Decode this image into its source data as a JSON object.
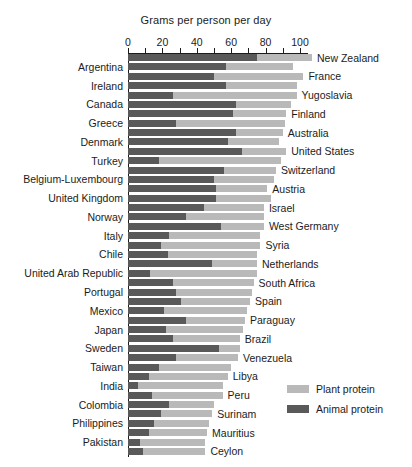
{
  "chart_data": {
    "type": "bar",
    "orientation": "horizontal",
    "stacked": true,
    "title": "Grams per person per day",
    "xlabel": "Grams per person per day",
    "ylabel": "",
    "xlim": [
      0,
      105
    ],
    "xticks": [
      0,
      10,
      20,
      30,
      40,
      50,
      60,
      70,
      80,
      90,
      100
    ],
    "xtick_labels": [
      "0",
      "",
      "20",
      "",
      "40",
      "",
      "60",
      "",
      "80",
      "",
      "100"
    ],
    "grid": false,
    "legend_position": "lower-right",
    "colors": {
      "plant_protein": "#b9b9b9",
      "animal_protein": "#595959",
      "axis": "#1b1b1b",
      "background": "#ffffff"
    },
    "series": [
      {
        "name": "Animal protein",
        "color": "#595959"
      },
      {
        "name": "Plant protein",
        "color": "#b9b9b9"
      }
    ],
    "label_side_note": "Labels alternate: odd-index rows labelled on the right, even-index rows labelled on the left",
    "categories": [
      "New Zealand",
      "Argentina",
      "France",
      "Ireland",
      "Yugoslavia",
      "Canada",
      "Finland",
      "Greece",
      "Australia",
      "Denmark",
      "United States",
      "Turkey",
      "Switzerland",
      "Belgium-Luxembourg",
      "Austria",
      "United Kingdom",
      "Israel",
      "Norway",
      "West Germany",
      "Italy",
      "Syria",
      "Chile",
      "Netherlands",
      "United Arab Republic",
      "South Africa",
      "Portugal",
      "Spain",
      "Mexico",
      "Paraguay",
      "Japan",
      "Brazil",
      "Sweden",
      "Venezuela",
      "Taiwan",
      "Libya",
      "India",
      "Peru",
      "Colombia",
      "Surinam",
      "Philippines",
      "Mauritius",
      "Pakistan",
      "Ceylon"
    ],
    "rows": [
      {
        "label": "New Zealand",
        "side": "right",
        "animal": 75,
        "plant": 32,
        "total": 107
      },
      {
        "label": "Argentina",
        "side": "left",
        "animal": 57,
        "plant": 39,
        "total": 96
      },
      {
        "label": "France",
        "side": "right",
        "animal": 50,
        "plant": 52,
        "total": 102
      },
      {
        "label": "Ireland",
        "side": "left",
        "animal": 57,
        "plant": 41,
        "total": 98
      },
      {
        "label": "Yugoslavia",
        "side": "right",
        "animal": 26,
        "plant": 72,
        "total": 98
      },
      {
        "label": "Canada",
        "side": "left",
        "animal": 63,
        "plant": 32,
        "total": 95
      },
      {
        "label": "Finland",
        "side": "right",
        "animal": 61,
        "plant": 31,
        "total": 92
      },
      {
        "label": "Greece",
        "side": "left",
        "animal": 28,
        "plant": 63,
        "total": 91
      },
      {
        "label": "Australia",
        "side": "right",
        "animal": 63,
        "plant": 27,
        "total": 90
      },
      {
        "label": "Denmark",
        "side": "left",
        "animal": 58,
        "plant": 30,
        "total": 88
      },
      {
        "label": "United States",
        "side": "right",
        "animal": 66,
        "plant": 26,
        "total": 92
      },
      {
        "label": "Turkey",
        "side": "left",
        "animal": 18,
        "plant": 71,
        "total": 89
      },
      {
        "label": "Switzerland",
        "side": "right",
        "animal": 56,
        "plant": 30,
        "total": 86
      },
      {
        "label": "Belgium-Luxembourg",
        "side": "left",
        "animal": 50,
        "plant": 35,
        "total": 85
      },
      {
        "label": "Austria",
        "side": "right",
        "animal": 51,
        "plant": 30,
        "total": 81
      },
      {
        "label": "United Kingdom",
        "side": "left",
        "animal": 51,
        "plant": 32,
        "total": 83
      },
      {
        "label": "Israel",
        "side": "right",
        "animal": 44,
        "plant": 35,
        "total": 79
      },
      {
        "label": "Norway",
        "side": "left",
        "animal": 34,
        "plant": 45,
        "total": 79
      },
      {
        "label": "West Germany",
        "side": "right",
        "animal": 54,
        "plant": 25,
        "total": 79
      },
      {
        "label": "Italy",
        "side": "left",
        "animal": 24,
        "plant": 53,
        "total": 77
      },
      {
        "label": "Syria",
        "side": "right",
        "animal": 19,
        "plant": 58,
        "total": 77
      },
      {
        "label": "Chile",
        "side": "left",
        "animal": 23,
        "plant": 52,
        "total": 75
      },
      {
        "label": "Netherlands",
        "side": "right",
        "animal": 49,
        "plant": 26,
        "total": 75
      },
      {
        "label": "United Arab Republic",
        "side": "left",
        "animal": 13,
        "plant": 62,
        "total": 75
      },
      {
        "label": "South Africa",
        "side": "right",
        "animal": 26,
        "plant": 47,
        "total": 73
      },
      {
        "label": "Portugal",
        "side": "left",
        "animal": 28,
        "plant": 44,
        "total": 72
      },
      {
        "label": "Spain",
        "side": "right",
        "animal": 31,
        "plant": 40,
        "total": 71
      },
      {
        "label": "Mexico",
        "side": "left",
        "animal": 21,
        "plant": 48,
        "total": 69
      },
      {
        "label": "Paraguay",
        "side": "right",
        "animal": 34,
        "plant": 34,
        "total": 68
      },
      {
        "label": "Japan",
        "side": "left",
        "animal": 22,
        "plant": 45,
        "total": 67
      },
      {
        "label": "Brazil",
        "side": "right",
        "animal": 26,
        "plant": 39,
        "total": 65
      },
      {
        "label": "Sweden",
        "side": "left",
        "animal": 53,
        "plant": 12,
        "total": 65
      },
      {
        "label": "Venezuela",
        "side": "right",
        "animal": 28,
        "plant": 36,
        "total": 64
      },
      {
        "label": "Taiwan",
        "side": "left",
        "animal": 18,
        "plant": 42,
        "total": 60
      },
      {
        "label": "Libya",
        "side": "right",
        "animal": 12,
        "plant": 46,
        "total": 58
      },
      {
        "label": "India",
        "side": "left",
        "animal": 6,
        "plant": 49,
        "total": 55
      },
      {
        "label": "Peru",
        "side": "right",
        "animal": 14,
        "plant": 41,
        "total": 55
      },
      {
        "label": "Colombia",
        "side": "left",
        "animal": 24,
        "plant": 26,
        "total": 50
      },
      {
        "label": "Surinam",
        "side": "right",
        "animal": 19,
        "plant": 30,
        "total": 49
      },
      {
        "label": "Philippines",
        "side": "left",
        "animal": 15,
        "plant": 32,
        "total": 47
      },
      {
        "label": "Mauritius",
        "side": "right",
        "animal": 12,
        "plant": 34,
        "total": 46
      },
      {
        "label": "Pakistan",
        "side": "left",
        "animal": 7,
        "plant": 38,
        "total": 45
      },
      {
        "label": "Ceylon",
        "side": "right",
        "animal": 9,
        "plant": 36,
        "total": 45
      }
    ],
    "legend": [
      {
        "label": "Plant protein",
        "color": "#b9b9b9"
      },
      {
        "label": "Animal protein",
        "color": "#595959"
      }
    ]
  }
}
